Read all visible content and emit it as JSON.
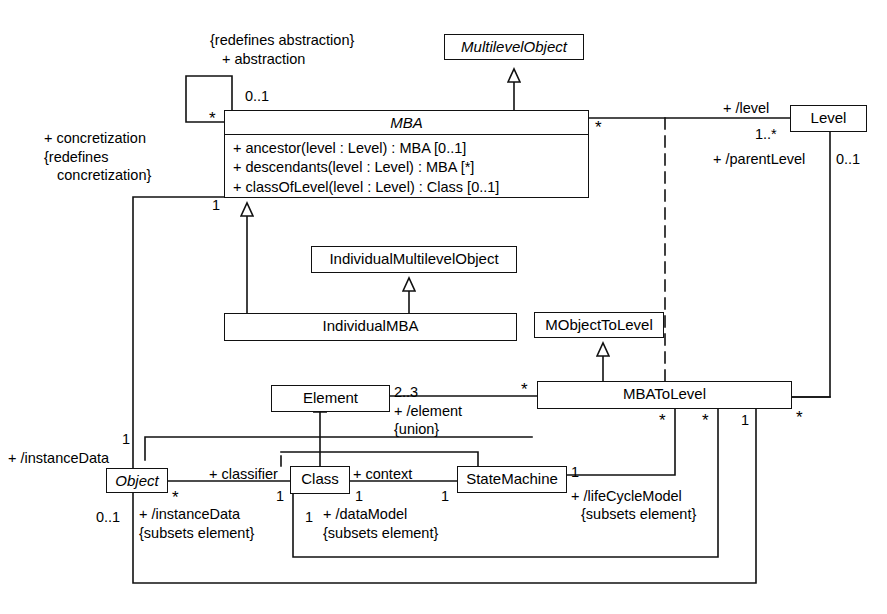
{
  "diagram": {
    "kind": "uml-class-diagram",
    "colors": {
      "line": "#111111",
      "fill": "#ffffff",
      "text": "#000000"
    }
  },
  "classes": [
    {
      "id": "multilevelobject",
      "name": "MultilevelObject",
      "abstract": true,
      "x": 444,
      "y": 34,
      "w": 140,
      "h": 26,
      "operations": []
    },
    {
      "id": "mba",
      "name": "MBA",
      "abstract": true,
      "x": 224,
      "y": 110,
      "w": 365,
      "h": 88,
      "operations": [
        "+ ancestor(level : Level) : MBA [0..1]",
        "+ descendants(level : Level) : MBA [*]",
        "+ classOfLevel(level : Level) : Class [0..1]"
      ]
    },
    {
      "id": "level",
      "name": "Level",
      "abstract": false,
      "x": 790,
      "y": 105,
      "w": 77,
      "h": 27,
      "operations": []
    },
    {
      "id": "individualmultilevelobject",
      "name": "IndividualMultilevelObject",
      "abstract": false,
      "x": 311,
      "y": 246,
      "w": 206,
      "h": 27,
      "operations": []
    },
    {
      "id": "individualmba",
      "name": "IndividualMBA",
      "abstract": false,
      "x": 224,
      "y": 313,
      "w": 293,
      "h": 28,
      "operations": []
    },
    {
      "id": "mobjecttolevel",
      "name": "MObjectToLevel",
      "abstract": false,
      "x": 534,
      "y": 312,
      "w": 130,
      "h": 26,
      "operations": []
    },
    {
      "id": "mbatolevel",
      "name": "MBAToLevel",
      "abstract": false,
      "x": 537,
      "y": 381,
      "w": 255,
      "h": 28,
      "operations": []
    },
    {
      "id": "element",
      "name": "Element",
      "abstract": false,
      "x": 271,
      "y": 385,
      "w": 119,
      "h": 27,
      "operations": []
    },
    {
      "id": "object",
      "name": "Object",
      "abstract": true,
      "x": 106,
      "y": 468,
      "w": 62,
      "h": 25,
      "operations": []
    },
    {
      "id": "class",
      "name": "Class",
      "abstract": false,
      "x": 290,
      "y": 466,
      "w": 60,
      "h": 28,
      "operations": []
    },
    {
      "id": "statemachine",
      "name": "StateMachine",
      "abstract": false,
      "x": 457,
      "y": 466,
      "w": 110,
      "h": 27,
      "operations": []
    }
  ],
  "annotations": [
    {
      "id": "redefines-abstraction",
      "text": "{redefines abstraction}",
      "x": 210,
      "y": 32
    },
    {
      "id": "abstraction-role",
      "text": "+ abstraction",
      "x": 222,
      "y": 51
    },
    {
      "id": "abstraction-mult",
      "text": "0..1",
      "x": 245,
      "y": 88
    },
    {
      "id": "concretization-role",
      "text": "+ concretization",
      "x": 44,
      "y": 130
    },
    {
      "id": "redefines-concret-1",
      "text": "{redefines",
      "x": 44,
      "y": 149
    },
    {
      "id": "redefines-concret-2",
      "text": "concretization}",
      "x": 57,
      "y": 167
    },
    {
      "id": "level-role",
      "text": "+ /level",
      "x": 723,
      "y": 100
    },
    {
      "id": "level-mult",
      "text": "1..*",
      "x": 755,
      "y": 126
    },
    {
      "id": "parentlevel-role",
      "text": "+ /parentLevel",
      "x": 713,
      "y": 151
    },
    {
      "id": "parentlevel-mult",
      "text": "0..1",
      "x": 836,
      "y": 151
    },
    {
      "id": "mba-bottom-mult",
      "text": "1",
      "x": 212,
      "y": 197
    },
    {
      "id": "element-mult",
      "text": "2..3",
      "x": 394,
      "y": 384
    },
    {
      "id": "element-role",
      "text": "+ /element",
      "x": 394,
      "y": 403
    },
    {
      "id": "element-union",
      "text": "{union}",
      "x": 394,
      "y": 421
    },
    {
      "id": "instancedata-role-top",
      "text": "+ /instanceData",
      "x": 8,
      "y": 450
    },
    {
      "id": "instancedata-mult-top",
      "text": "1",
      "x": 122,
      "y": 431
    },
    {
      "id": "instancedata-mult-bot",
      "text": "0..1",
      "x": 96,
      "y": 509
    },
    {
      "id": "instancedata-role-bot",
      "text": "+ /instanceData",
      "x": 139,
      "y": 506
    },
    {
      "id": "instancedata-subsets",
      "text": "{subsets element}",
      "x": 139,
      "y": 525
    },
    {
      "id": "classifier-role",
      "text": "+ classifier",
      "x": 209,
      "y": 466
    },
    {
      "id": "classifier-mult-left",
      "text": "*",
      "x": 172,
      "y": 489
    },
    {
      "id": "classifier-mult-right",
      "text": "1",
      "x": 276,
      "y": 488
    },
    {
      "id": "datamodel-mult",
      "text": "1",
      "x": 305,
      "y": 509
    },
    {
      "id": "datamodel-role",
      "text": "+ /dataModel",
      "x": 323,
      "y": 506
    },
    {
      "id": "datamodel-subsets",
      "text": "{subsets element}",
      "x": 323,
      "y": 525
    },
    {
      "id": "context-role",
      "text": "+ context",
      "x": 353,
      "y": 466
    },
    {
      "id": "context-mult-left",
      "text": "1",
      "x": 355,
      "y": 488
    },
    {
      "id": "context-mult-right",
      "text": "1",
      "x": 441,
      "y": 488
    },
    {
      "id": "lifecycle-mult",
      "text": "1",
      "x": 571,
      "y": 464
    },
    {
      "id": "lifecycle-role",
      "text": "+ /lifeCycleModel",
      "x": 571,
      "y": 488
    },
    {
      "id": "lifecycle-subsets",
      "text": "{subsets element}",
      "x": 581,
      "y": 506
    },
    {
      "id": "mba-right-star",
      "text": "*",
      "x": 595,
      "y": 119
    },
    {
      "id": "selfassoc-star",
      "text": "*",
      "x": 209,
      "y": 110
    },
    {
      "id": "mbatolevel-left-star",
      "text": "*",
      "x": 521,
      "y": 381
    },
    {
      "id": "mbatolevel-right-star",
      "text": "*",
      "x": 796,
      "y": 409
    },
    {
      "id": "mbatolevel-drop-star1",
      "text": "*",
      "x": 659,
      "y": 412
    },
    {
      "id": "mbatolevel-drop-star2",
      "text": "*",
      "x": 702,
      "y": 412
    },
    {
      "id": "mbatolevel-drop-one",
      "text": "1",
      "x": 741,
      "y": 412
    }
  ]
}
